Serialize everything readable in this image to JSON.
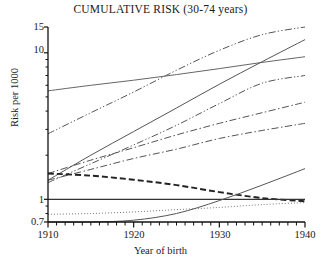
{
  "chart_data": {
    "type": "line",
    "title": "CUMULATIVE RISK (30-74 years)",
    "xlabel": "Year of birth",
    "ylabel": "Risk per 1000",
    "yscale": "log",
    "ylim": [
      0.7,
      15
    ],
    "xlim": [
      1910,
      1940
    ],
    "grid": false,
    "legend": "none",
    "ytick_labels": [
      "15",
      "10",
      "1",
      "0.7"
    ],
    "ytick_values": [
      15,
      10,
      1,
      0.7
    ],
    "xtick_labels": [
      "1910",
      "1920",
      "1930",
      "1940"
    ],
    "xtick_values": [
      1910,
      1920,
      1930,
      1940
    ],
    "x_minor_tick_interval": 1,
    "x": [
      1910,
      1915,
      1920,
      1925,
      1930,
      1935,
      1940
    ],
    "series": [
      {
        "name": "series-1",
        "style": "dash-dot-dot",
        "color": "#555555",
        "values": [
          2.8,
          3.9,
          5.4,
          7.6,
          10.4,
          13.3,
          15.0
        ]
      },
      {
        "name": "series-2",
        "style": "solid",
        "color": "#666666",
        "values": [
          5.5,
          6.0,
          6.5,
          7.1,
          7.8,
          8.6,
          9.4
        ]
      },
      {
        "name": "series-3",
        "style": "solid",
        "color": "#555555",
        "values": [
          1.35,
          2.0,
          2.9,
          4.2,
          6.1,
          8.7,
          12.3
        ]
      },
      {
        "name": "series-4",
        "style": "dash-dot-dot",
        "color": "#555555",
        "values": [
          1.3,
          1.75,
          2.35,
          3.2,
          4.5,
          6.2,
          7.0
        ]
      },
      {
        "name": "series-5",
        "style": "dash-dot",
        "color": "#555555",
        "values": [
          1.5,
          1.85,
          2.25,
          2.75,
          3.3,
          3.9,
          4.6
        ]
      },
      {
        "name": "series-6",
        "style": "dash-dot",
        "color": "#555555",
        "values": [
          1.35,
          1.6,
          1.9,
          2.2,
          2.6,
          2.95,
          3.3
        ]
      },
      {
        "name": "series-7",
        "style": "dashed-thick",
        "color": "#222222",
        "values": [
          1.5,
          1.45,
          1.36,
          1.25,
          1.12,
          1.02,
          0.97
        ]
      },
      {
        "name": "series-8",
        "style": "solid-flat",
        "color": "#333333",
        "values": [
          1.0,
          1.0,
          1.0,
          1.0,
          1.0,
          1.0,
          1.0
        ]
      },
      {
        "name": "series-9",
        "style": "dotted",
        "color": "#777777",
        "values": [
          0.79,
          0.8,
          0.82,
          0.85,
          0.88,
          0.92,
          0.95
        ]
      },
      {
        "name": "series-10",
        "style": "solid",
        "color": "#555555",
        "values": [
          0.7,
          0.7,
          0.72,
          0.8,
          0.98,
          1.25,
          1.62
        ]
      }
    ]
  },
  "axes": {
    "title": "CUMULATIVE RISK (30-74 years)",
    "ylabel": "Risk per 1000",
    "xlabel": "Year of birth",
    "ytick_0": "15",
    "ytick_1": "10",
    "ytick_2": "1",
    "ytick_3": "0.7",
    "xtick_0": "1910",
    "xtick_1": "1920",
    "xtick_2": "1930",
    "xtick_3": "1940"
  }
}
